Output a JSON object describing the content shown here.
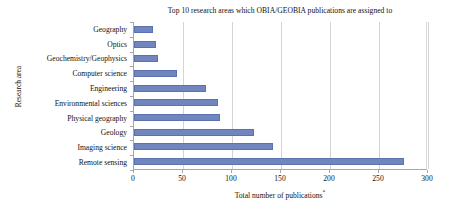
{
  "chart_data": {
    "type": "bar",
    "orientation": "horizontal",
    "title": "Top 10 research areas which OBIA/GEOBIA publications are assigned to",
    "xlabel": "Total number of publications",
    "xlabel_superscript": "*",
    "ylabel": "Research area",
    "categories": [
      "Geography",
      "Optics",
      "Geochemistry/Geophysics",
      "Computer science",
      "Engineering",
      "Environmental sciences",
      "Physical geography",
      "Geology",
      "Imaging science",
      "Remote sensing"
    ],
    "values": [
      19,
      22,
      24,
      44,
      73,
      86,
      88,
      122,
      142,
      276
    ],
    "xlim": [
      0,
      300
    ],
    "xticks": [
      0,
      50,
      100,
      150,
      200,
      250,
      300
    ],
    "xtick_labels": [
      "0",
      "50",
      "100",
      "150",
      "200",
      "250",
      "300"
    ],
    "grid": "vertical",
    "legend": "none",
    "bar_color": "#7186be",
    "bar_edge_color": "#5b72ae",
    "gridline_color": "#d4d4d4",
    "axis_color": "#a6a6a6"
  }
}
